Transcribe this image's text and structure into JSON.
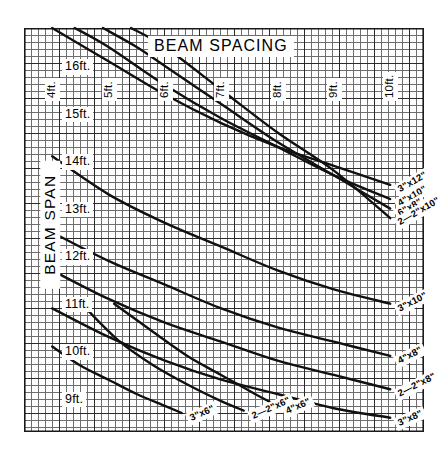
{
  "chart_data": {
    "type": "line",
    "title": "BEAM SPACING",
    "xlabel": "BEAM SPACING",
    "ylabel": "BEAM SPAN",
    "grid": true,
    "grid_style": "engineering graph paper, minor 1 unit, major every 5 units",
    "legend": "inline curve end labels",
    "x_tick_labels": [
      "4ft.",
      "5ft.",
      "6ft.",
      "7ft.",
      "8ft.",
      "9ft.",
      "10ft."
    ],
    "x_values": [
      4,
      5,
      6,
      7,
      8,
      9,
      10
    ],
    "xlim": [
      3.5,
      10.6
    ],
    "y_tick_labels": [
      "16ft.",
      "15ft.",
      "14ft.",
      "13ft.",
      "12ft.",
      "11ft.",
      "10ft.",
      "9ft."
    ],
    "y_values": [
      16,
      15,
      14,
      13,
      12,
      11,
      10,
      9
    ],
    "ylim": [
      8.3,
      16.8
    ],
    "series": [
      {
        "name": "3\"x12\"",
        "label": "3\"x12\"",
        "label_angle": -30,
        "points": [
          [
            4.0,
            16.8
          ],
          [
            5.0,
            16.1
          ],
          [
            6.0,
            15.4
          ],
          [
            7.0,
            14.8
          ],
          [
            8.0,
            14.3
          ],
          [
            9.0,
            13.9
          ],
          [
            10.0,
            13.5
          ]
        ]
      },
      {
        "name": "4\"x10\"",
        "label": "4\"x10\"",
        "label_angle": -30,
        "points": [
          [
            4.4,
            16.8
          ],
          [
            5.0,
            16.4
          ],
          [
            6.0,
            15.6
          ],
          [
            7.0,
            14.9
          ],
          [
            8.0,
            14.3
          ],
          [
            9.0,
            13.7
          ],
          [
            10.0,
            13.2
          ]
        ]
      },
      {
        "name": "6\"x8\"",
        "label": "6\"x8\"",
        "label_angle": -30,
        "points": [
          [
            4.9,
            16.8
          ],
          [
            5.5,
            16.4
          ],
          [
            6.0,
            16.0
          ],
          [
            7.0,
            15.2
          ],
          [
            8.0,
            14.4
          ],
          [
            9.0,
            13.7
          ],
          [
            10.0,
            13.0
          ]
        ]
      },
      {
        "name": "2—2\"x10\"",
        "label": "2—2\"x10\"",
        "label_angle": -30,
        "points": [
          [
            5.4,
            16.8
          ],
          [
            6.0,
            16.4
          ],
          [
            7.0,
            15.5
          ],
          [
            8.0,
            14.6
          ],
          [
            9.0,
            13.8
          ],
          [
            10.0,
            12.8
          ]
        ]
      },
      {
        "name": "3\"x10\"",
        "label": "3\"x10\"",
        "label_angle": -27,
        "points": [
          [
            4.0,
            14.1
          ],
          [
            5.0,
            13.3
          ],
          [
            6.0,
            12.7
          ],
          [
            7.0,
            12.2
          ],
          [
            8.0,
            11.7
          ],
          [
            9.0,
            11.3
          ],
          [
            10.0,
            11.0
          ]
        ]
      },
      {
        "name": "4\"x8\"",
        "label": "4\"x8\"",
        "label_angle": -27,
        "points": [
          [
            4.0,
            12.5
          ],
          [
            5.0,
            11.9
          ],
          [
            6.0,
            11.4
          ],
          [
            7.0,
            10.9
          ],
          [
            8.0,
            10.5
          ],
          [
            9.0,
            10.2
          ],
          [
            10.0,
            9.9
          ]
        ]
      },
      {
        "name": "2—2\"x8\"",
        "label": "2—2\"x8\"",
        "label_angle": -27,
        "points": [
          [
            4.0,
            11.7
          ],
          [
            5.0,
            11.1
          ],
          [
            6.0,
            10.6
          ],
          [
            7.0,
            10.2
          ],
          [
            8.0,
            9.8
          ],
          [
            9.0,
            9.5
          ],
          [
            10.0,
            9.2
          ]
        ]
      },
      {
        "name": "3\"x8\"",
        "label": "3\"x8\"",
        "label_angle": -24,
        "points": [
          [
            4.0,
            10.9
          ],
          [
            5.0,
            10.3
          ],
          [
            6.0,
            9.8
          ],
          [
            7.0,
            9.4
          ],
          [
            8.0,
            9.1
          ],
          [
            9.0,
            8.8
          ],
          [
            10.0,
            8.6
          ]
        ]
      },
      {
        "name": "3\"x6\"",
        "label": "3\"x6\"",
        "label_angle": -24,
        "points": [
          [
            4.0,
            10.1
          ],
          [
            4.5,
            9.7
          ],
          [
            5.0,
            9.4
          ],
          [
            5.5,
            9.1
          ],
          [
            6.0,
            8.85
          ],
          [
            6.3,
            8.7
          ]
        ]
      },
      {
        "name": "2—2\"x6\"",
        "label": "2—2\"x6\"",
        "label_angle": -24,
        "points": [
          [
            4.6,
            10.9
          ],
          [
            5.2,
            10.2
          ],
          [
            5.8,
            9.7
          ],
          [
            6.4,
            9.3
          ],
          [
            7.0,
            8.95
          ],
          [
            7.4,
            8.75
          ]
        ]
      },
      {
        "name": "4\"x6\"",
        "label": "4\"x6\"",
        "label_angle": -24,
        "points": [
          [
            5.1,
            11.0
          ],
          [
            5.8,
            10.4
          ],
          [
            6.4,
            9.9
          ],
          [
            7.0,
            9.5
          ],
          [
            7.6,
            9.1
          ],
          [
            8.0,
            8.85
          ]
        ]
      }
    ]
  },
  "axes": {
    "top_title": "BEAM SPACING",
    "left_title": "BEAM SPAN",
    "columns": [
      {
        "label": "4ft.",
        "x": 4
      },
      {
        "label": "5ft.",
        "x": 5
      },
      {
        "label": "6ft.",
        "x": 6
      },
      {
        "label": "7ft.",
        "x": 7
      },
      {
        "label": "8ft.",
        "x": 8
      },
      {
        "label": "9ft.",
        "x": 9
      },
      {
        "label": "10ft.",
        "x": 10
      }
    ],
    "rows": [
      {
        "label": "16ft.",
        "y": 16
      },
      {
        "label": "15ft.",
        "y": 15
      },
      {
        "label": "14ft.",
        "y": 14
      },
      {
        "label": "13ft.",
        "y": 13
      },
      {
        "label": "12ft.",
        "y": 12
      },
      {
        "label": "11ft.",
        "y": 11
      },
      {
        "label": "10ft.",
        "y": 10
      },
      {
        "label": "9ft.",
        "y": 9
      }
    ]
  },
  "style": {
    "curve_color": "#111111",
    "grid_major_color": "#2b2b2b",
    "grid_minor_color": "#6e6e6e",
    "background": "#ffffff"
  }
}
